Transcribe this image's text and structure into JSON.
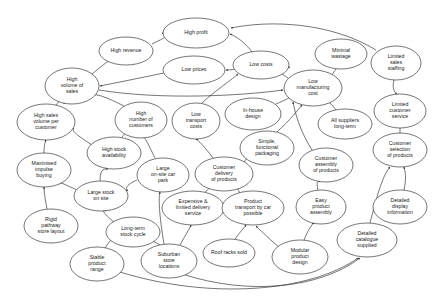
{
  "diagram": {
    "style": {
      "background": "#ffffff",
      "node_fill": "#ffffff",
      "node_stroke": "#2b2b2b",
      "edge_stroke": "#2b2b2b",
      "label_color": "#222222"
    },
    "nodes": [
      {
        "id": "high_profit",
        "label": "High profit",
        "lines": [
          "High profit"
        ],
        "cx": 196,
        "cy": 33,
        "rx": 33,
        "ry": 15
      },
      {
        "id": "high_revenue",
        "label": "High revenue",
        "lines": [
          "High revenue"
        ],
        "cx": 126,
        "cy": 51,
        "rx": 27,
        "ry": 14
      },
      {
        "id": "low_prices",
        "label": "Low prices",
        "lines": [
          "Low prices"
        ],
        "cx": 194,
        "cy": 70,
        "rx": 31,
        "ry": 14
      },
      {
        "id": "low_costs",
        "label": "Low costs",
        "lines": [
          "Low costs"
        ],
        "cx": 261,
        "cy": 65,
        "rx": 28,
        "ry": 14
      },
      {
        "id": "minimal_wastage",
        "label": "Minimal wastage",
        "lines": [
          "Minimal",
          "wastage"
        ],
        "cx": 341,
        "cy": 54,
        "rx": 26,
        "ry": 15
      },
      {
        "id": "limited_sales_staffing",
        "label": "Limited sales staffing",
        "lines": [
          "Limited",
          "sales",
          "staffing"
        ],
        "cx": 396,
        "cy": 63,
        "rx": 25,
        "ry": 17
      },
      {
        "id": "high_volume_sales",
        "label": "High volume of sales",
        "lines": [
          "High",
          "volume of",
          "sales"
        ],
        "cx": 72,
        "cy": 86,
        "rx": 27,
        "ry": 18
      },
      {
        "id": "low_mfg_cost",
        "label": "Low manufacturing cost",
        "lines": [
          "Low",
          "manufacturing",
          "cost"
        ],
        "cx": 313,
        "cy": 88,
        "rx": 29,
        "ry": 18
      },
      {
        "id": "high_sales_vol_cust",
        "label": "High sales volume per customer",
        "lines": [
          "High sales",
          "volume per",
          "customer"
        ],
        "cx": 46,
        "cy": 122,
        "rx": 29,
        "ry": 18
      },
      {
        "id": "high_num_customers",
        "label": "High number of customers",
        "lines": [
          "High",
          "number of",
          "customers"
        ],
        "cx": 141,
        "cy": 120,
        "rx": 26,
        "ry": 18
      },
      {
        "id": "low_transport_costs",
        "label": "Low transport costs",
        "lines": [
          "Low",
          "transport",
          "costs"
        ],
        "cx": 196,
        "cy": 121,
        "rx": 24,
        "ry": 18
      },
      {
        "id": "inhouse_design",
        "label": "In-house design",
        "lines": [
          "In-house",
          "design"
        ],
        "cx": 253,
        "cy": 114,
        "rx": 28,
        "ry": 16
      },
      {
        "id": "limited_cust_service",
        "label": "Limited customer service",
        "lines": [
          "Limited",
          "customer",
          "service"
        ],
        "cx": 400,
        "cy": 111,
        "rx": 26,
        "ry": 17
      },
      {
        "id": "all_suppliers_lt",
        "label": "All suppliers long-term",
        "lines": [
          "All suppliers",
          "long-term"
        ],
        "cx": 345,
        "cy": 124,
        "rx": 27,
        "ry": 15
      },
      {
        "id": "high_stock_avail",
        "label": "High stock availability",
        "lines": [
          "High stock",
          "availability"
        ],
        "cx": 114,
        "cy": 153,
        "rx": 27,
        "ry": 16
      },
      {
        "id": "simple_packaging",
        "label": "Simple, functional packaging",
        "lines": [
          "Simple,",
          "functional",
          "packaging"
        ],
        "cx": 267,
        "cy": 148,
        "rx": 27,
        "ry": 17
      },
      {
        "id": "cust_selection",
        "label": "Customer selection of products",
        "lines": [
          "Customer",
          "selection",
          "of products"
        ],
        "cx": 400,
        "cy": 150,
        "rx": 27,
        "ry": 17
      },
      {
        "id": "maximised_impulse",
        "label": "Maximised impulse buying",
        "lines": [
          "Maximised",
          "impulse",
          "buying"
        ],
        "cx": 44,
        "cy": 170,
        "rx": 27,
        "ry": 17
      },
      {
        "id": "large_car_park",
        "label": "Large on-site car park",
        "lines": [
          "Large",
          "on-site car",
          "park"
        ],
        "cx": 163,
        "cy": 175,
        "rx": 26,
        "ry": 17
      },
      {
        "id": "cust_delivery",
        "label": "Customer delivery of products",
        "lines": [
          "Customer",
          "delivery",
          "of products"
        ],
        "cx": 224,
        "cy": 174,
        "rx": 29,
        "ry": 17
      },
      {
        "id": "cust_assembly",
        "label": "Customer assembly of products",
        "lines": [
          "Customer",
          "assembly",
          "of products"
        ],
        "cx": 326,
        "cy": 165,
        "rx": 27,
        "ry": 17
      },
      {
        "id": "large_stock_onsite",
        "label": "Large stock on site",
        "lines": [
          "Large stock",
          "on site"
        ],
        "cx": 101,
        "cy": 196,
        "rx": 27,
        "ry": 15
      },
      {
        "id": "expensive_delivery",
        "label": "Expensive & limited delivery service",
        "lines": [
          "Expensive &",
          "limited delivery",
          "service"
        ],
        "cx": 193,
        "cy": 208,
        "rx": 31,
        "ry": 17
      },
      {
        "id": "product_transport",
        "label": "Product transport by car possible",
        "lines": [
          "Product",
          "transport by car",
          "possible"
        ],
        "cx": 253,
        "cy": 208,
        "rx": 31,
        "ry": 17
      },
      {
        "id": "easy_assembly",
        "label": "Easy product assembly",
        "lines": [
          "Easy",
          "product",
          "assembly"
        ],
        "cx": 321,
        "cy": 207,
        "rx": 25,
        "ry": 17
      },
      {
        "id": "detailed_display",
        "label": "Detailed display information",
        "lines": [
          "Detailed",
          "display",
          "information"
        ],
        "cx": 400,
        "cy": 207,
        "rx": 27,
        "ry": 17
      },
      {
        "id": "rigid_pathway",
        "label": "Rigid pathway store layout",
        "lines": [
          "Rigid",
          "pathway",
          "store layout"
        ],
        "cx": 51,
        "cy": 226,
        "rx": 27,
        "ry": 17
      },
      {
        "id": "long_term_stock",
        "label": "Long-term stock cycle",
        "lines": [
          "Long-term",
          "stock cycle"
        ],
        "cx": 133,
        "cy": 232,
        "rx": 27,
        "ry": 15
      },
      {
        "id": "detailed_catalogue",
        "label": "Detailed catalogue supplied",
        "lines": [
          "Detailed",
          "catalogue",
          "supplied"
        ],
        "cx": 367,
        "cy": 240,
        "rx": 30,
        "ry": 17
      },
      {
        "id": "stable_product",
        "label": "Stable product range",
        "lines": [
          "Stable",
          "product",
          "range"
        ],
        "cx": 97,
        "cy": 264,
        "rx": 27,
        "ry": 17
      },
      {
        "id": "suburban_stores",
        "label": "Suburban store locations",
        "lines": [
          "Suburban",
          "store",
          "locations"
        ],
        "cx": 169,
        "cy": 261,
        "rx": 28,
        "ry": 17
      },
      {
        "id": "roof_racks",
        "label": "Roof racks sold",
        "lines": [
          "Roof racks sold"
        ],
        "cx": 229,
        "cy": 253,
        "rx": 26,
        "ry": 14
      },
      {
        "id": "modular_design",
        "label": "Modular product design",
        "lines": [
          "Modular",
          "product",
          "design"
        ],
        "cx": 300,
        "cy": 257,
        "rx": 28,
        "ry": 17
      }
    ],
    "edges": [
      {
        "from": "high_revenue",
        "to": "high_profit",
        "path": "M 152,44 C 164,38 172,35 162,33"
      },
      {
        "from": "high_volume_sales",
        "to": "high_revenue",
        "path": "M 92,74 C 104,64 110,60 112,58"
      },
      {
        "from": "low_prices",
        "to": "high_volume_sales",
        "path": "M 164,73 C 130,80 110,84 100,86"
      },
      {
        "from": "low_costs",
        "to": "low_prices",
        "path": "M 236,69 C 230,70 228,70 226,70"
      },
      {
        "from": "low_costs",
        "to": "high_profit",
        "path": "M 252,52 C 246,44 238,37 230,34"
      },
      {
        "from": "low_mfg_cost",
        "to": "low_costs",
        "path": "M 288,78 C 280,73 276,70 290,67"
      },
      {
        "from": "minimal_wastage",
        "to": "low_mfg_cost",
        "path": "M 336,69 C 332,75 330,78 328,74"
      },
      {
        "from": "limited_sales_staffing",
        "to": "high_profit",
        "path": "M 376,50 C 330,22 270,20 231,28"
      },
      {
        "from": "limited_sales_staffing",
        "to": "limited_cust_service",
        "path": "M 394,80 C 392,88 394,92 397,94"
      },
      {
        "from": "limited_cust_service",
        "to": "cust_selection",
        "path": "M 400,128 C 400,132 400,134 400,133"
      },
      {
        "from": "all_suppliers_lt",
        "to": "low_mfg_cost",
        "path": "M 336,110 C 330,102 326,98 322,105"
      },
      {
        "from": "inhouse_design",
        "to": "low_mfg_cost",
        "path": "M 276,104 C 290,98 298,94 286,92"
      },
      {
        "from": "high_volume_sales",
        "to": "low_mfg_cost",
        "path": "M 99,90 C 160,100 240,96 283,90"
      },
      {
        "from": "high_num_customers",
        "to": "high_volume_sales",
        "path": "M 124,106 C 108,98 94,92 92,96"
      },
      {
        "from": "high_sales_vol_cust",
        "to": "high_volume_sales",
        "path": "M 56,105 C 62,98 66,96 64,104"
      },
      {
        "from": "maximised_impulse",
        "to": "high_sales_vol_cust",
        "path": "M 44,153 C 44,146 45,142 46,140"
      },
      {
        "from": "high_stock_avail",
        "to": "high_sales_vol_cust",
        "path": "M 92,145 C 78,136 70,130 74,128"
      },
      {
        "from": "high_stock_avail",
        "to": "high_num_customers",
        "path": "M 122,137 C 128,130 132,126 134,137"
      },
      {
        "from": "large_stock_onsite",
        "to": "high_stock_avail",
        "path": "M 100,181 C 100,172 102,168 108,169"
      },
      {
        "from": "large_stock_onsite",
        "to": "maximised_impulse",
        "path": "M 77,190 C 64,184 56,180 58,184"
      },
      {
        "from": "rigid_pathway",
        "to": "maximised_impulse",
        "path": "M 47,209 C 45,198 44,192 44,187"
      },
      {
        "from": "long_term_stock",
        "to": "large_stock_onsite",
        "path": "M 115,223 C 104,214 100,208 106,211"
      },
      {
        "from": "stable_product",
        "to": "long_term_stock",
        "path": "M 105,248 C 110,240 114,236 118,240"
      },
      {
        "from": "large_car_park",
        "to": "high_num_customers",
        "path": "M 155,158 C 148,144 144,134 142,138"
      },
      {
        "from": "large_car_park",
        "to": "large_stock_onsite",
        "path": "M 137,180 C 128,184 124,188 128,191"
      },
      {
        "from": "suburban_stores",
        "to": "large_car_park",
        "path": "M 164,244 C 160,220 158,200 160,192"
      },
      {
        "from": "suburban_stores",
        "to": "long_term_stock",
        "path": "M 160,245 C 152,240 146,238 143,240"
      },
      {
        "from": "cust_delivery",
        "to": "low_transport_costs",
        "path": "M 213,158 C 204,146 198,140 196,139"
      },
      {
        "from": "low_transport_costs",
        "to": "low_costs",
        "path": "M 202,103 C 216,90 234,78 238,74"
      },
      {
        "from": "expensive_delivery",
        "to": "cust_delivery",
        "path": "M 205,192 C 212,186 216,182 214,186"
      },
      {
        "from": "product_transport",
        "to": "cust_delivery",
        "path": "M 240,193 C 236,186 234,184 240,184"
      },
      {
        "from": "roof_racks",
        "to": "product_transport",
        "path": "M 235,239 C 240,232 244,228 246,225"
      },
      {
        "from": "suburban_stores",
        "to": "expensive_delivery",
        "path": "M 180,245 C 186,234 190,228 191,225"
      },
      {
        "from": "simple_packaging",
        "to": "low_mfg_cost",
        "path": "M 277,132 C 290,120 298,110 302,105"
      },
      {
        "from": "simple_packaging",
        "to": "cust_delivery",
        "path": "M 248,157 C 242,164 240,168 251,172"
      },
      {
        "from": "cust_assembly",
        "to": "low_mfg_cost",
        "path": "M 312,150 C 302,134 296,118 293,102"
      },
      {
        "from": "easy_assembly",
        "to": "cust_assembly",
        "path": "M 318,190 C 316,182 318,180 320,182"
      },
      {
        "from": "modular_design",
        "to": "easy_assembly",
        "path": "M 304,240 C 308,230 312,224 314,223"
      },
      {
        "from": "modular_design",
        "to": "product_transport",
        "path": "M 280,248 C 266,236 258,228 256,226"
      },
      {
        "from": "detailed_catalogue",
        "to": "cust_selection",
        "path": "M 370,223 C 376,200 382,176 390,167"
      },
      {
        "from": "detailed_display",
        "to": "cust_selection",
        "path": "M 404,190 C 406,180 406,174 404,167"
      },
      {
        "from": "suburban_stores",
        "to": "detailed_catalogue",
        "path": "M 182,274 C 250,296 320,288 360,258"
      },
      {
        "from": "stable_product",
        "to": "detailed_catalogue",
        "path": "M 120,272 C 210,300 310,292 358,258"
      }
    ]
  }
}
